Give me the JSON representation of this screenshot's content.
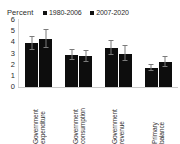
{
  "chart_data": {
    "type": "bar",
    "title": "",
    "subtitle": "",
    "ylabel": "Percent",
    "xlabel": "",
    "ylim": [
      0,
      6
    ],
    "yticks": [
      0,
      1,
      2,
      3,
      4,
      5,
      6
    ],
    "grid": false,
    "legend_position": "top",
    "orientation": "vertical",
    "error_bars": true,
    "categories": [
      "Government expenditure",
      "Government consumption",
      "Government revenue",
      "Primary balance"
    ],
    "category_lines": [
      [
        "Government",
        "expenditure"
      ],
      [
        "Government",
        "consumption"
      ],
      [
        "Government",
        "revenue"
      ],
      [
        "Primary",
        "balance"
      ]
    ],
    "series": [
      {
        "name": "1980-2006",
        "color": "#0d0d0d",
        "values": [
          3.9,
          2.9,
          3.5,
          1.7
        ],
        "err_low": [
          0.55,
          0.45,
          0.6,
          0.3
        ],
        "err_high": [
          0.55,
          0.45,
          0.6,
          0.3
        ]
      },
      {
        "name": "2007-2020",
        "color": "#0d0d0d",
        "values": [
          4.3,
          2.75,
          3.0,
          2.25
        ],
        "err_low": [
          0.85,
          0.5,
          0.65,
          0.45
        ],
        "err_high": [
          0.85,
          0.5,
          0.65,
          0.45
        ]
      }
    ]
  },
  "legend": {
    "axis_title": "Percent",
    "entries": [
      {
        "label": "1980-2006",
        "swatch_color": "#111111"
      },
      {
        "label": "2007-2020",
        "swatch_color": "#111111"
      }
    ]
  },
  "axis": {
    "y_tick_labels": [
      "6",
      "5",
      "4",
      "3",
      "2",
      "1",
      "0"
    ]
  },
  "colors": {
    "bar": "#0d0d0d",
    "error_bar": "#7b7b7b",
    "axis": "#c9c9c9",
    "text": "#2b2b2b",
    "background": "#ffffff"
  }
}
